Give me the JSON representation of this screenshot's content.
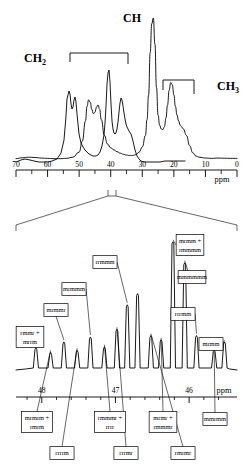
{
  "figure": {
    "kind": "nmr-spectrum",
    "technique": "13C NMR",
    "unit_label": "ppm",
    "ppm_label_main": "ppm",
    "ppm_label_expansion": "ppm"
  },
  "group_labels": {
    "ch2": {
      "base": "CH",
      "sub": "2"
    },
    "ch": {
      "base": "CH",
      "sub": ""
    },
    "ch3": {
      "base": "CH",
      "sub": "3"
    }
  },
  "chart_data": [
    {
      "type": "line",
      "id": "main-spectrum",
      "title": "",
      "xlabel": "ppm",
      "ylabel": "",
      "xlim": [
        70,
        0
      ],
      "ylim": [
        0,
        1
      ],
      "grid": false,
      "legend": "none",
      "axis_ticks_major": [
        70,
        60,
        50,
        40,
        30,
        20,
        10,
        0
      ],
      "axis_ticks_labels": [
        "70",
        "60",
        "50",
        "40",
        "30",
        "20",
        "10",
        "0"
      ],
      "axis_ticks_minor": [
        65,
        55,
        45,
        35,
        25,
        15,
        5
      ],
      "annotations": [
        {
          "text": "CH2",
          "region_ppm": [
            52.5,
            35.5
          ],
          "kind": "bracket"
        },
        {
          "text": "CH",
          "region_ppm": [
            27.0,
            27.0
          ],
          "kind": "peak-label"
        },
        {
          "text": "CH3",
          "region_ppm": [
            23.5,
            14.5
          ],
          "kind": "bracket"
        }
      ],
      "peaks": [
        {
          "ppm": 46.8,
          "height": 0.44,
          "assignment": "CH2"
        },
        {
          "ppm": 44.2,
          "height": 0.4,
          "assignment": "CH2"
        },
        {
          "ppm": 26.5,
          "height": 1.0,
          "assignment": "CH"
        },
        {
          "ppm": 21.0,
          "height": 0.56,
          "assignment": "CH3"
        },
        {
          "ppm": 17.5,
          "height": 0.24,
          "assignment": "CH3"
        }
      ],
      "x": [
        70,
        68,
        66,
        64,
        62,
        60,
        58,
        56,
        54,
        52,
        50,
        49,
        48,
        47.5,
        47,
        46.5,
        46,
        45.5,
        45,
        44.5,
        44,
        43.5,
        43,
        42,
        41,
        40,
        39,
        38,
        37,
        36,
        35,
        34,
        33,
        32,
        31,
        30,
        29,
        28.5,
        28,
        27.5,
        27,
        26.5,
        26,
        25.5,
        25,
        24.5,
        24,
        23.5,
        23,
        22.5,
        22,
        21.5,
        21,
        20.5,
        20,
        19.5,
        19,
        18.5,
        18,
        17.5,
        17,
        16,
        15,
        14,
        13,
        12,
        10,
        8,
        6,
        4,
        2,
        0
      ],
      "y": [
        0.03,
        0.036,
        0.04,
        0.038,
        0.034,
        0.032,
        0.03,
        0.03,
        0.032,
        0.04,
        0.075,
        0.15,
        0.29,
        0.39,
        0.435,
        0.42,
        0.37,
        0.34,
        0.35,
        0.385,
        0.4,
        0.37,
        0.3,
        0.19,
        0.13,
        0.105,
        0.09,
        0.078,
        0.068,
        0.06,
        0.055,
        0.052,
        0.052,
        0.058,
        0.075,
        0.11,
        0.19,
        0.3,
        0.47,
        0.76,
        0.96,
        1.0,
        0.82,
        0.52,
        0.33,
        0.26,
        0.235,
        0.23,
        0.25,
        0.31,
        0.4,
        0.5,
        0.555,
        0.54,
        0.47,
        0.39,
        0.33,
        0.29,
        0.262,
        0.248,
        0.235,
        0.19,
        0.12,
        0.07,
        0.048,
        0.04,
        0.034,
        0.032,
        0.034,
        0.033,
        0.032,
        0.032
      ]
    },
    {
      "type": "line",
      "id": "expansion-spectrum",
      "title": "",
      "xlabel": "ppm",
      "ylabel": "",
      "xlim": [
        48.35,
        45.35
      ],
      "ylim": [
        0,
        1
      ],
      "grid": false,
      "legend": "none",
      "axis_ticks_major": [
        48,
        47,
        46
      ],
      "axis_ticks_labels": [
        "48",
        "47",
        "46"
      ],
      "axis_ticks_minor": [
        48.2,
        47.8,
        47.6,
        47.4,
        47.2,
        46.8,
        46.6,
        46.4,
        46.2,
        45.8,
        45.6
      ],
      "expanded_from_ppm": [
        48.35,
        45.35
      ],
      "peaks": [
        {
          "ppm": 48.08,
          "height": 0.175,
          "assignment": "rmmr + mrrm"
        },
        {
          "ppm": 47.88,
          "height": 0.14,
          "assignment": "mrmrm + rmrm"
        },
        {
          "ppm": 47.7,
          "height": 0.215,
          "assignment": "mrmmr"
        },
        {
          "ppm": 47.52,
          "height": 0.155,
          "assignment": "rrrrm"
        },
        {
          "ppm": 47.34,
          "height": 0.25,
          "assignment": "mrmmm"
        },
        {
          "ppm": 47.15,
          "height": 0.18,
          "assignment": "rmmmr + rrrr"
        },
        {
          "ppm": 46.98,
          "height": 0.305,
          "assignment": "rrmmm"
        },
        {
          "ppm": 46.84,
          "height": 0.48,
          "assignment": "rrmmm"
        },
        {
          "ppm": 46.7,
          "height": 0.56,
          "assignment": "rrmmm"
        },
        {
          "ppm": 46.52,
          "height": 0.26,
          "assignment": "rrrmr"
        },
        {
          "ppm": 46.38,
          "height": 0.23,
          "assignment": "mrmr + rmmmr"
        },
        {
          "ppm": 46.22,
          "height": 0.93,
          "assignment": "mrmm + rmmmm"
        },
        {
          "ppm": 46.06,
          "height": 0.78,
          "assignment": "mmmmmm"
        },
        {
          "ppm": 45.9,
          "height": 0.26,
          "assignment": "rrrmm"
        },
        {
          "ppm": 45.66,
          "height": 0.16,
          "assignment": "rmrmr"
        },
        {
          "ppm": 45.52,
          "height": 0.215,
          "assignment": "mrmm / mmrmm"
        }
      ]
    }
  ],
  "expansion_labels_top": [
    {
      "id": "rmmr-mrrm",
      "line1": "rmmr +",
      "line2": "mrrm"
    },
    {
      "id": "mrmmr",
      "line1": "mrmmr",
      "line2": ""
    },
    {
      "id": "mrmmm",
      "line1": "mrmmm",
      "line2": ""
    },
    {
      "id": "rrmmm",
      "line1": "rrmmm",
      "line2": ""
    },
    {
      "id": "mrmm-rmmmm",
      "line1": "mrmm +",
      "line2": "rmmmm"
    },
    {
      "id": "mmmmmm",
      "line1": "mmmmmm",
      "line2": ""
    },
    {
      "id": "rrrmm",
      "line1": "rrrmm",
      "line2": ""
    },
    {
      "id": "mrmm",
      "line1": "mrmm",
      "line2": ""
    }
  ],
  "expansion_labels_bottom": [
    {
      "id": "mrmrm-rmrm",
      "line1": "mrmrm +",
      "line2": "rmrm"
    },
    {
      "id": "rrrrm",
      "line1": "rrrrm",
      "line2": ""
    },
    {
      "id": "rmmmr-rrrr",
      "line1": "rmmmr +",
      "line2": "rrrr"
    },
    {
      "id": "rrrmr",
      "line1": "rrrmr",
      "line2": ""
    },
    {
      "id": "mrmr-rmmmr",
      "line1": "mrmr +",
      "line2": "rmmmr"
    },
    {
      "id": "rmrmr",
      "line1": "rmrmr",
      "line2": ""
    },
    {
      "id": "mmrmm",
      "line1": "mmrmm",
      "line2": ""
    }
  ],
  "colors": {
    "stroke": "#000000",
    "background": "#ffffff",
    "box_fill": "#ffffff"
  }
}
